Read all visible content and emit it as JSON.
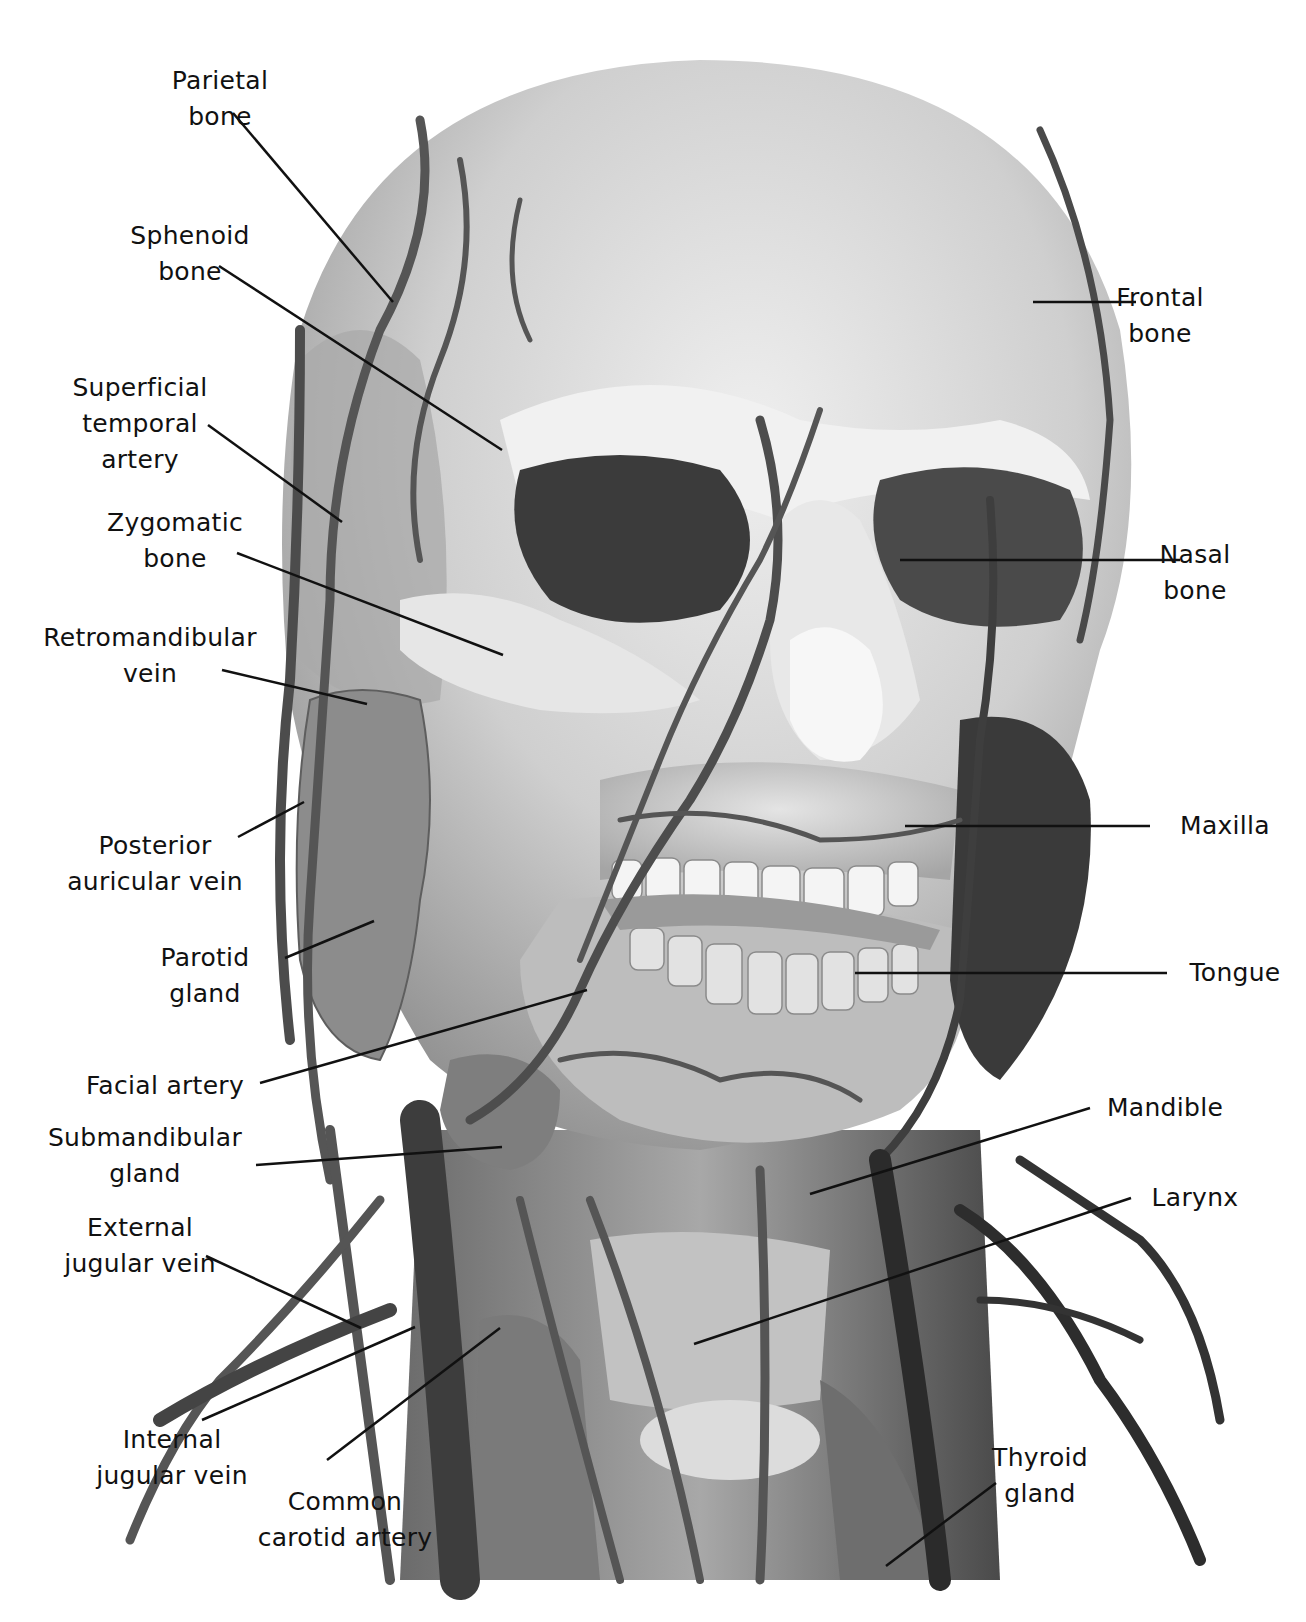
{
  "figure": {
    "colors": {
      "background": "#ffffff",
      "bone": "#d9d9d9",
      "bone_shadow": "#8a8a8a",
      "vessel": "#5a5a5a",
      "vessel_dark": "#2e2e2e",
      "gland": "#7c7c7c",
      "teeth": "#f2f2f2",
      "label_text": "#111111",
      "leader_line": "#111111"
    }
  },
  "labels": {
    "left": [
      {
        "id": "parietal-bone",
        "text": "Parietal\nbone"
      },
      {
        "id": "sphenoid-bone",
        "text": "Sphenoid\nbone"
      },
      {
        "id": "superficial-temporal-artery",
        "text": "Superficial\ntemporal\nartery"
      },
      {
        "id": "zygomatic-bone",
        "text": "Zygomatic\nbone"
      },
      {
        "id": "retromandibular-vein",
        "text": "Retromandibular\nvein"
      },
      {
        "id": "posterior-auricular-vein",
        "text": "Posterior\nauricular vein"
      },
      {
        "id": "parotid-gland",
        "text": "Parotid\ngland"
      },
      {
        "id": "facial-artery",
        "text": "Facial artery"
      },
      {
        "id": "submandibular-gland",
        "text": "Submandibular\ngland"
      },
      {
        "id": "external-jugular-vein",
        "text": "External\njugular vein"
      },
      {
        "id": "internal-jugular-vein",
        "text": "Internal\njugular vein"
      },
      {
        "id": "common-carotid-artery",
        "text": "Common\ncarotid artery"
      }
    ],
    "right": [
      {
        "id": "frontal-bone",
        "text": "Frontal\nbone"
      },
      {
        "id": "nasal-bone",
        "text": "Nasal\nbone"
      },
      {
        "id": "maxilla",
        "text": "Maxilla"
      },
      {
        "id": "tongue",
        "text": "Tongue"
      },
      {
        "id": "mandible",
        "text": "Mandible"
      },
      {
        "id": "larynx",
        "text": "Larynx"
      },
      {
        "id": "thyroid-gland",
        "text": "Thyroid\ngland"
      }
    ]
  }
}
